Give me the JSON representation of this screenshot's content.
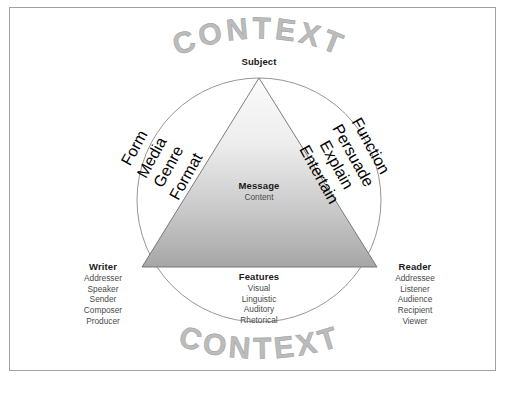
{
  "figure": {
    "type": "rhetorical-triangle-diagram",
    "context_top": "CONTEXT",
    "context_bottom": "CONTEXT",
    "colors": {
      "frame_border": "#a0a0a0",
      "context_text": "#bcbcbc",
      "triangle_fill_top": "#f2f2f2",
      "triangle_fill_bottom": "#a6a6a6",
      "triangle_stroke": "#6e6e6e",
      "circle_stroke": "#8a8a8a",
      "heading_text": "#1b1b1b",
      "item_text": "#4a4a4a"
    }
  },
  "apex": {
    "heading": "Subject"
  },
  "center": {
    "heading": "Message",
    "items": [
      "Content"
    ]
  },
  "left_vertex": {
    "heading": "Writer",
    "items": [
      "Addresser",
      "Speaker",
      "Sender",
      "Composer",
      "Producer"
    ]
  },
  "right_vertex": {
    "heading": "Reader",
    "items": [
      "Addressee",
      "Listener",
      "Audience",
      "Recipient",
      "Viewer"
    ]
  },
  "bottom_edge": {
    "heading": "Features",
    "items": [
      "Visual",
      "Linguistic",
      "Auditory",
      "Rhetorical"
    ]
  },
  "left_edge": {
    "heading": "Form",
    "items": [
      "Media",
      "Genre",
      "Format"
    ]
  },
  "right_edge": {
    "heading": "Function",
    "items": [
      "Persuade",
      "Explain",
      "Entertain"
    ]
  }
}
